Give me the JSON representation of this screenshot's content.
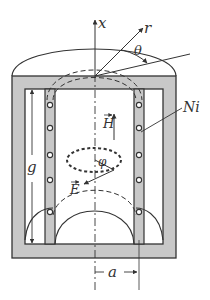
{
  "diagram": {
    "labels": {
      "x_axis": "x",
      "r_axis": "r",
      "theta": "θ",
      "current": "Ni",
      "H_field": "H",
      "E_field": "E",
      "phi": "φ",
      "gap": "g",
      "radius": "a"
    },
    "colors": {
      "core_fill": "#c8c8c8",
      "stroke": "#333333",
      "background": "#ffffff"
    }
  }
}
